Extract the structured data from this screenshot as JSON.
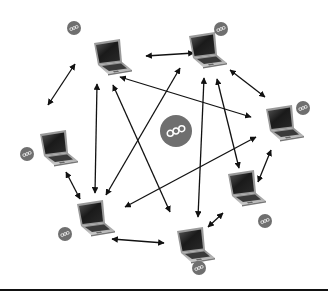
{
  "diagram": {
    "type": "peer-to-peer network",
    "colors": {
      "background": "#ffffff",
      "arrow": "#111111",
      "badge_fill": "#6f6f6f",
      "badge_glyph": "#ffffff",
      "laptop_body": "#b9b9b9",
      "laptop_screen": "#1e1e1e",
      "rule": "#111111"
    },
    "central_badge": {
      "icon": "p2p-network-icon",
      "cx": 176,
      "cy": 131,
      "r": 16
    },
    "nodes": [
      {
        "id": "L1",
        "label": "laptop-top-left",
        "x": 110,
        "y": 57,
        "badge": {
          "cx": 74,
          "cy": 28,
          "r": 7
        }
      },
      {
        "id": "L2",
        "label": "laptop-top-center",
        "x": 205,
        "y": 50,
        "badge": {
          "cx": 221,
          "cy": 29,
          "r": 7
        }
      },
      {
        "id": "L3",
        "label": "laptop-right",
        "x": 282,
        "y": 123,
        "badge": {
          "cx": 303,
          "cy": 108,
          "r": 7
        }
      },
      {
        "id": "L4",
        "label": "laptop-left",
        "x": 56,
        "y": 148,
        "badge": {
          "cx": 27,
          "cy": 154,
          "r": 7
        }
      },
      {
        "id": "L5",
        "label": "laptop-right-lower",
        "x": 244,
        "y": 188,
        "badge": {
          "cx": 265,
          "cy": 221,
          "r": 7
        }
      },
      {
        "id": "L6",
        "label": "laptop-bottom-left",
        "x": 93,
        "y": 218,
        "badge": {
          "cx": 65,
          "cy": 234,
          "r": 7
        }
      },
      {
        "id": "L7",
        "label": "laptop-bottom-center",
        "x": 193,
        "y": 245,
        "badge": {
          "cx": 199,
          "cy": 268,
          "r": 7
        }
      }
    ],
    "edges": [
      {
        "from": "L1",
        "to": "L2",
        "x1": 146,
        "y1": 56,
        "x2": 194,
        "y2": 53
      },
      {
        "from": "L1",
        "to": "L3",
        "x1": 120,
        "y1": 77,
        "x2": 251,
        "y2": 117
      },
      {
        "from": "L1",
        "to": "L4",
        "x1": 75,
        "y1": 64,
        "x2": 48,
        "y2": 105
      },
      {
        "from": "L1",
        "to": "L6",
        "x1": 97,
        "y1": 84,
        "x2": 95,
        "y2": 193
      },
      {
        "from": "L1",
        "to": "L7",
        "x1": 113,
        "y1": 85,
        "x2": 170,
        "y2": 212
      },
      {
        "from": "L2",
        "to": "L6",
        "x1": 180,
        "y1": 68,
        "x2": 106,
        "y2": 195
      },
      {
        "from": "L2",
        "to": "L7",
        "x1": 204,
        "y1": 78,
        "x2": 198,
        "y2": 217
      },
      {
        "from": "L2",
        "to": "L5",
        "x1": 217,
        "y1": 79,
        "x2": 239,
        "y2": 168
      },
      {
        "from": "L2",
        "to": "L3",
        "x1": 230,
        "y1": 70,
        "x2": 265,
        "y2": 97
      },
      {
        "from": "L3",
        "to": "L6",
        "x1": 256,
        "y1": 137,
        "x2": 125,
        "y2": 207
      },
      {
        "from": "L3",
        "to": "L5",
        "x1": 271,
        "y1": 150,
        "x2": 258,
        "y2": 182
      },
      {
        "from": "L5",
        "to": "L7",
        "x1": 223,
        "y1": 213,
        "x2": 208,
        "y2": 227
      },
      {
        "from": "L6",
        "to": "L7",
        "x1": 112,
        "y1": 239,
        "x2": 164,
        "y2": 243
      },
      {
        "from": "L4",
        "to": "L6",
        "x1": 66,
        "y1": 172,
        "x2": 80,
        "y2": 199
      }
    ]
  }
}
